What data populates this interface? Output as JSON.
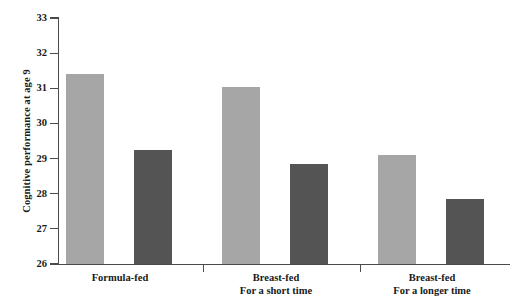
{
  "chart_data": {
    "type": "bar",
    "title": "",
    "xlabel": "",
    "ylabel": "Cognitive performance at age 9",
    "ylim": [
      26,
      33
    ],
    "ytick_labels": [
      "33",
      "32",
      "31",
      "30",
      "29",
      "28",
      "27",
      "26"
    ],
    "yticks": [
      33,
      32,
      31,
      30,
      29,
      28,
      27,
      26
    ],
    "grid": false,
    "legend": false,
    "categories": [
      "Formula-fed",
      "Breast-fed For a short time",
      "Breast-fed For a longer time"
    ],
    "category_lines": [
      {
        "line1": "Formula-fed",
        "line2": ""
      },
      {
        "line1": "Breast-fed",
        "line2": "For a short time"
      },
      {
        "line1": "Breast-fed",
        "line2": "For a longer time"
      }
    ],
    "series": [
      {
        "name": "light-series",
        "color": "#a6a6a6",
        "values": [
          31.4,
          31.05,
          29.1
        ]
      },
      {
        "name": "dark-series",
        "color": "#545454",
        "values": [
          29.25,
          28.85,
          27.85
        ]
      }
    ],
    "bars": [
      {
        "group": 0,
        "series": 0,
        "value": 31.4,
        "color": "#a6a6a6",
        "x": 66,
        "width": 38
      },
      {
        "group": 0,
        "series": 1,
        "value": 29.25,
        "color": "#545454",
        "x": 134,
        "width": 38
      },
      {
        "group": 1,
        "series": 0,
        "value": 31.05,
        "color": "#a6a6a6",
        "x": 222,
        "width": 38
      },
      {
        "group": 1,
        "series": 1,
        "value": 28.85,
        "color": "#545454",
        "x": 290,
        "width": 38
      },
      {
        "group": 2,
        "series": 0,
        "value": 29.1,
        "color": "#a6a6a6",
        "x": 378,
        "width": 38
      },
      {
        "group": 2,
        "series": 1,
        "value": 27.85,
        "color": "#545454",
        "x": 446,
        "width": 38
      }
    ],
    "group_separators": [
      203,
      360
    ],
    "group_label_centers": [
      120,
      276,
      432
    ]
  },
  "axis": {
    "line_color": "#4a4a4a"
  },
  "colors": {
    "background": "#ffffff",
    "light_bar": "#a6a6a6",
    "dark_bar": "#545454",
    "axis": "#4a4a4a",
    "text": "#1a1a1a"
  }
}
